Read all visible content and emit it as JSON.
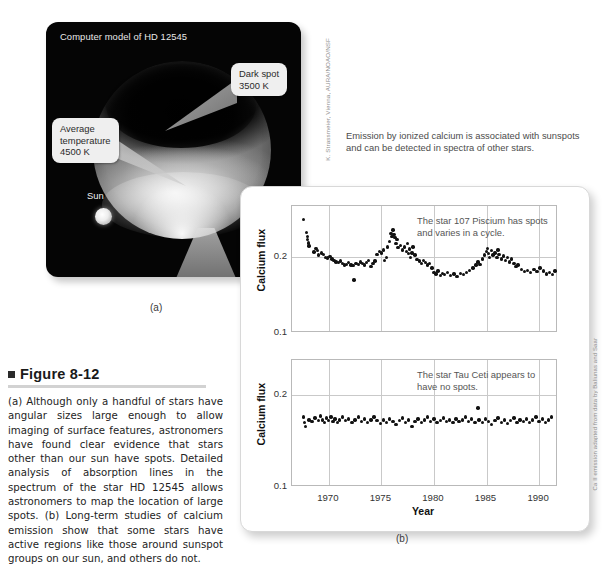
{
  "panel_a": {
    "title": "Computer model of HD 12545",
    "sun_label": "Sun",
    "callouts": [
      {
        "name": "dark-spot",
        "text": "Dark spot\n3500 K"
      },
      {
        "name": "average-temperature",
        "text": "Average\ntemperature\n4500 K"
      },
      {
        "name": "bright-spot",
        "text": "Bright spot\n4800 K"
      }
    ],
    "panel_label": "(a)",
    "credit": "K. Strassmeier, Vienna, AURA/NOAO/NSF"
  },
  "emission_note": "Emission by ionized calcium is associated with sunspots and can be detected in spectra of other stars.",
  "panel_b": {
    "panel_label": "(b)",
    "credit": "Ca II emission adapted from data by Baliunas and Saar"
  },
  "caption": {
    "figure_number": "Figure 8-12",
    "body": "(a) Although only a handful of stars have angular sizes large enough to allow imaging of surface features, astronomers have found clear evidence that stars other than our sun have spots. Detailed analysis of absorption lines in the spectrum of the star HD 12545 allows astronomers to map the location of large spots. (b) Long-term studies of calcium emission show that some stars have active regions like those around sunspot groups on our sun, and others do not."
  },
  "chart_data": [
    {
      "type": "scatter",
      "id": "top",
      "title": "",
      "annotation": "The star 107 Piscium has spots and varies in a cycle.",
      "xlabel": "",
      "ylabel": "Calcium flux",
      "xlim": [
        1966.5,
        1991.8
      ],
      "ylim": [
        0.1,
        0.268
      ],
      "xticks": [
        1970,
        1975,
        1980,
        1985,
        1990
      ],
      "yticks": [
        0.1,
        0.2
      ],
      "grid": true,
      "points": [
        [
          1967.6,
          0.25
        ],
        [
          1967.9,
          0.233
        ],
        [
          1967.95,
          0.228
        ],
        [
          1968.0,
          0.224
        ],
        [
          1968.05,
          0.219
        ],
        [
          1968.1,
          0.215
        ],
        [
          1968.6,
          0.207
        ],
        [
          1968.8,
          0.212
        ],
        [
          1968.9,
          0.209
        ],
        [
          1969.0,
          0.203
        ],
        [
          1969.3,
          0.206
        ],
        [
          1969.5,
          0.204
        ],
        [
          1969.7,
          0.2
        ],
        [
          1969.9,
          0.199
        ],
        [
          1970.1,
          0.201
        ],
        [
          1970.3,
          0.198
        ],
        [
          1970.5,
          0.196
        ],
        [
          1970.7,
          0.194
        ],
        [
          1970.9,
          0.193
        ],
        [
          1971.1,
          0.195
        ],
        [
          1971.3,
          0.192
        ],
        [
          1971.5,
          0.19
        ],
        [
          1971.7,
          0.191
        ],
        [
          1971.9,
          0.193
        ],
        [
          1972.1,
          0.19
        ],
        [
          1972.3,
          0.189
        ],
        [
          1972.4,
          0.17
        ],
        [
          1972.6,
          0.192
        ],
        [
          1972.8,
          0.191
        ],
        [
          1973.0,
          0.194
        ],
        [
          1973.2,
          0.192
        ],
        [
          1973.4,
          0.19
        ],
        [
          1973.6,
          0.193
        ],
        [
          1973.8,
          0.196
        ],
        [
          1974.0,
          0.188
        ],
        [
          1974.2,
          0.192
        ],
        [
          1974.4,
          0.195
        ],
        [
          1974.6,
          0.204
        ],
        [
          1974.8,
          0.208
        ],
        [
          1975.0,
          0.206
        ],
        [
          1975.2,
          0.21
        ],
        [
          1975.3,
          0.196
        ],
        [
          1975.5,
          0.2
        ],
        [
          1975.6,
          0.214
        ],
        [
          1975.8,
          0.221
        ],
        [
          1975.9,
          0.232
        ],
        [
          1976.0,
          0.228
        ],
        [
          1976.1,
          0.236
        ],
        [
          1976.2,
          0.23
        ],
        [
          1976.3,
          0.226
        ],
        [
          1976.4,
          0.218
        ],
        [
          1976.5,
          0.224
        ],
        [
          1976.6,
          0.213
        ],
        [
          1976.8,
          0.216
        ],
        [
          1977.0,
          0.21
        ],
        [
          1977.2,
          0.214
        ],
        [
          1977.4,
          0.208
        ],
        [
          1977.5,
          0.218
        ],
        [
          1977.6,
          0.205
        ],
        [
          1977.7,
          0.211
        ],
        [
          1977.8,
          0.2
        ],
        [
          1977.9,
          0.206
        ],
        [
          1978.0,
          0.214
        ],
        [
          1978.2,
          0.203
        ],
        [
          1978.4,
          0.197
        ],
        [
          1978.6,
          0.195
        ],
        [
          1978.8,
          0.192
        ],
        [
          1979.0,
          0.196
        ],
        [
          1979.2,
          0.193
        ],
        [
          1979.4,
          0.19
        ],
        [
          1979.6,
          0.192
        ],
        [
          1979.8,
          0.186
        ],
        [
          1980.0,
          0.18
        ],
        [
          1980.2,
          0.178
        ],
        [
          1980.4,
          0.182
        ],
        [
          1980.6,
          0.176
        ],
        [
          1980.8,
          0.179
        ],
        [
          1981.0,
          0.177
        ],
        [
          1981.3,
          0.18
        ],
        [
          1981.6,
          0.176
        ],
        [
          1981.9,
          0.178
        ],
        [
          1982.2,
          0.175
        ],
        [
          1982.5,
          0.179
        ],
        [
          1982.8,
          0.177
        ],
        [
          1983.1,
          0.18
        ],
        [
          1983.4,
          0.183
        ],
        [
          1983.7,
          0.186
        ],
        [
          1984.0,
          0.19
        ],
        [
          1984.2,
          0.194
        ],
        [
          1984.4,
          0.191
        ],
        [
          1984.6,
          0.198
        ],
        [
          1984.8,
          0.203
        ],
        [
          1985.0,
          0.208
        ],
        [
          1985.1,
          0.212
        ],
        [
          1985.2,
          0.205
        ],
        [
          1985.3,
          0.2
        ],
        [
          1985.5,
          0.209
        ],
        [
          1985.6,
          0.203
        ],
        [
          1985.8,
          0.206
        ],
        [
          1986.0,
          0.2
        ],
        [
          1986.1,
          0.21
        ],
        [
          1986.2,
          0.204
        ],
        [
          1986.4,
          0.198
        ],
        [
          1986.6,
          0.202
        ],
        [
          1986.8,
          0.196
        ],
        [
          1987.0,
          0.2
        ],
        [
          1987.2,
          0.194
        ],
        [
          1987.4,
          0.198
        ],
        [
          1987.6,
          0.192
        ],
        [
          1987.8,
          0.188
        ],
        [
          1988.0,
          0.19
        ],
        [
          1988.3,
          0.184
        ],
        [
          1988.6,
          0.181
        ],
        [
          1988.9,
          0.183
        ],
        [
          1989.2,
          0.18
        ],
        [
          1989.5,
          0.184
        ],
        [
          1989.8,
          0.181
        ],
        [
          1990.1,
          0.186
        ],
        [
          1990.4,
          0.182
        ],
        [
          1990.7,
          0.178
        ],
        [
          1991.0,
          0.18
        ],
        [
          1991.3,
          0.177
        ],
        [
          1991.5,
          0.182
        ]
      ]
    },
    {
      "type": "scatter",
      "id": "bottom",
      "title": "",
      "annotation": "The star Tau Ceti appears to have no spots.",
      "xlabel": "Year",
      "ylabel": "Calcium flux",
      "xlim": [
        1966.5,
        1991.8
      ],
      "ylim": [
        0.1,
        0.238
      ],
      "xticks": [
        1970,
        1975,
        1980,
        1985,
        1990
      ],
      "yticks": [
        0.1,
        0.2
      ],
      "grid": true,
      "points": [
        [
          1967.6,
          0.176
        ],
        [
          1967.7,
          0.17
        ],
        [
          1967.8,
          0.166
        ],
        [
          1968.1,
          0.173
        ],
        [
          1968.4,
          0.171
        ],
        [
          1968.7,
          0.175
        ],
        [
          1969.0,
          0.172
        ],
        [
          1969.2,
          0.177
        ],
        [
          1969.4,
          0.173
        ],
        [
          1969.6,
          0.17
        ],
        [
          1969.8,
          0.175
        ],
        [
          1970.0,
          0.172
        ],
        [
          1970.2,
          0.176
        ],
        [
          1970.4,
          0.171
        ],
        [
          1970.6,
          0.174
        ],
        [
          1970.8,
          0.17
        ],
        [
          1971.0,
          0.173
        ],
        [
          1971.3,
          0.176
        ],
        [
          1971.6,
          0.172
        ],
        [
          1971.9,
          0.174
        ],
        [
          1972.2,
          0.17
        ],
        [
          1972.5,
          0.173
        ],
        [
          1972.8,
          0.176
        ],
        [
          1973.1,
          0.171
        ],
        [
          1973.4,
          0.174
        ],
        [
          1973.7,
          0.17
        ],
        [
          1974.0,
          0.173
        ],
        [
          1974.3,
          0.176
        ],
        [
          1974.6,
          0.172
        ],
        [
          1974.9,
          0.169
        ],
        [
          1975.2,
          0.173
        ],
        [
          1975.5,
          0.17
        ],
        [
          1975.8,
          0.174
        ],
        [
          1976.1,
          0.171
        ],
        [
          1976.4,
          0.168
        ],
        [
          1976.7,
          0.172
        ],
        [
          1977.0,
          0.175
        ],
        [
          1977.3,
          0.17
        ],
        [
          1977.6,
          0.173
        ],
        [
          1977.9,
          0.166
        ],
        [
          1978.2,
          0.171
        ],
        [
          1978.5,
          0.174
        ],
        [
          1978.8,
          0.17
        ],
        [
          1979.1,
          0.173
        ],
        [
          1979.4,
          0.176
        ],
        [
          1979.7,
          0.171
        ],
        [
          1980.0,
          0.174
        ],
        [
          1980.3,
          0.17
        ],
        [
          1980.6,
          0.172
        ],
        [
          1980.9,
          0.175
        ],
        [
          1981.2,
          0.171
        ],
        [
          1981.5,
          0.173
        ],
        [
          1981.8,
          0.17
        ],
        [
          1982.1,
          0.174
        ],
        [
          1982.4,
          0.171
        ],
        [
          1982.7,
          0.173
        ],
        [
          1983.0,
          0.176
        ],
        [
          1983.3,
          0.171
        ],
        [
          1983.6,
          0.174
        ],
        [
          1983.9,
          0.17
        ],
        [
          1984.2,
          0.186
        ],
        [
          1984.3,
          0.173
        ],
        [
          1984.6,
          0.17
        ],
        [
          1984.9,
          0.174
        ],
        [
          1985.2,
          0.171
        ],
        [
          1985.5,
          0.168
        ],
        [
          1985.8,
          0.172
        ],
        [
          1986.1,
          0.175
        ],
        [
          1986.4,
          0.17
        ],
        [
          1986.7,
          0.173
        ],
        [
          1987.0,
          0.169
        ],
        [
          1987.3,
          0.172
        ],
        [
          1987.6,
          0.175
        ],
        [
          1987.9,
          0.17
        ],
        [
          1988.2,
          0.173
        ],
        [
          1988.5,
          0.171
        ],
        [
          1988.8,
          0.174
        ],
        [
          1989.1,
          0.17
        ],
        [
          1989.4,
          0.173
        ],
        [
          1989.7,
          0.176
        ],
        [
          1990.0,
          0.171
        ],
        [
          1990.3,
          0.174
        ],
        [
          1990.6,
          0.17
        ],
        [
          1990.9,
          0.173
        ],
        [
          1991.2,
          0.176
        ]
      ]
    }
  ]
}
